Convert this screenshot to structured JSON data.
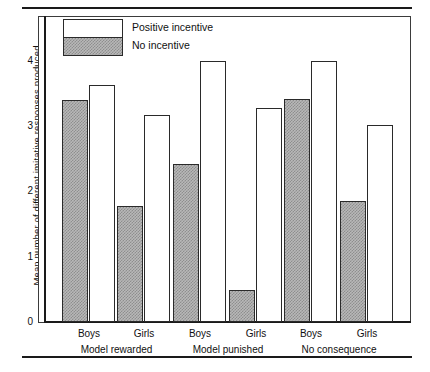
{
  "chart_data": {
    "type": "bar",
    "title": "",
    "subtitle": "",
    "xlabel": "",
    "ylabel": "Mean number of different imitative responses produced",
    "ylim": [
      0,
      4.7
    ],
    "yticks": [
      0,
      1,
      2,
      3,
      4
    ],
    "ytick_labels": [
      "0",
      "1",
      "2",
      "3",
      "4"
    ],
    "grid": false,
    "legend_position": "top-left",
    "groups": [
      "Model rewarded",
      "Model punished",
      "No consequence"
    ],
    "subgroups": [
      "Boys",
      "Girls"
    ],
    "categories": [
      "Model rewarded - Boys",
      "Model rewarded - Girls",
      "Model punished - Boys",
      "Model punished - Girls",
      "No consequence - Boys",
      "No consequence - Girls"
    ],
    "series": [
      {
        "name": "No incentive",
        "fill": "hatched-grey",
        "color": "#b8b8b8",
        "values": [
          3.4,
          1.78,
          2.42,
          0.49,
          3.41,
          1.86
        ]
      },
      {
        "name": "Positive incentive",
        "fill": "white",
        "color": "#ffffff",
        "values": [
          3.63,
          3.17,
          4.0,
          3.28,
          4.0,
          3.02
        ]
      }
    ]
  },
  "legend": {
    "entries": [
      {
        "label": "Positive incentive",
        "swatch": "white"
      },
      {
        "label": "No incentive",
        "swatch": "hatched-grey"
      }
    ]
  },
  "axis": {
    "y_title": "Mean number of different imitative responses produced",
    "y_ticks": [
      "4",
      "3",
      "2",
      "1",
      "0"
    ]
  },
  "x_axis": {
    "sub_labels": [
      "Boys",
      "Girls",
      "Boys",
      "Girls",
      "Boys",
      "Girls"
    ],
    "group_labels": [
      "Model rewarded",
      "Model punished",
      "No consequence"
    ]
  },
  "colors": {
    "ink": "#1a1a1a",
    "bar_outline": "#2a2a2a",
    "hatch_light": "#b8b8b8",
    "hatch_dark": "#8e8e8e",
    "background": "#ffffff"
  }
}
